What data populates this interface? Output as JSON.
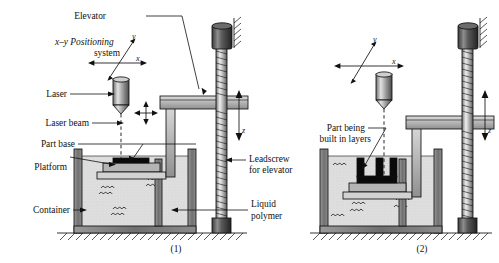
{
  "figure": {
    "title_internal": "Stereolithography process diagram",
    "panels": [
      {
        "id": "panel-1",
        "caption": "(1)",
        "labels": {
          "elevator": "Elevator",
          "xy_positioning_line1": "x–y Positioning",
          "xy_positioning_line2": "system",
          "laser": "Laser",
          "laser_beam": "Laser beam",
          "part_base": "Part base",
          "platform": "Platform",
          "container": "Container",
          "leadscrew_line1": "Leadscrew",
          "leadscrew_line2": "for elevator",
          "liquid_polymer_line1": "Liquid",
          "liquid_polymer_line2": "polymer"
        },
        "axes": {
          "x": "x",
          "y": "y",
          "z": "z"
        }
      },
      {
        "id": "panel-2",
        "caption": "(2)",
        "labels": {
          "part_being_line1": "Part being",
          "part_being_line2": "built in layers"
        },
        "axes": {
          "x": "x",
          "y": "y",
          "z": "z"
        }
      }
    ]
  },
  "colors": {
    "ink": "#111111",
    "liquid_fill": "#dcdcdc",
    "metal_light": "#c9c9c9",
    "metal_mid": "#a8a8a8",
    "metal_dark": "#6d6d6d",
    "part_black": "#0a0a0a",
    "paper": "#ffffff"
  }
}
